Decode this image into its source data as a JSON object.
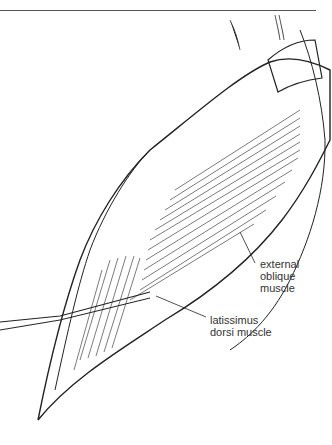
{
  "figure": {
    "type": "medical-illustration",
    "labels": {
      "external_oblique": [
        "external",
        "oblique",
        "muscle"
      ],
      "latissimus_dorsi": [
        "latissimus",
        "dorsi muscle"
      ]
    }
  }
}
